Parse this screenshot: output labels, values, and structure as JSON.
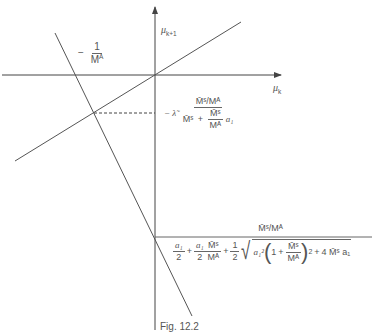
{
  "axes": {
    "x_label_symbol": "μ",
    "x_label_sub": "k",
    "y_label_symbol": "μ",
    "y_label_sub": "k+1"
  },
  "labels": {
    "slope_label": {
      "sign": "−",
      "numerator": "1",
      "denominator_base": "M",
      "denominator_sup": "A"
    },
    "intersection_label": {
      "prefix": "− λ̃",
      "numerator": "M̄ˢ/Mᴬ",
      "den_term1": "M̄ˢ",
      "plus": "+",
      "den_frac_num": "M̄ˢ",
      "den_frac_den": "Mᴬ",
      "den_tail": "a₁"
    },
    "intercept_label": {
      "numerator": "M̄ˢ/Mᴬ",
      "t1_num": "a₁",
      "t1_den": "2",
      "plus1": "+",
      "t2_num": "a₁",
      "t2_den": "2",
      "t2_frac_num": "M̄ˢ",
      "t2_frac_den": "Mᴬ",
      "plus2": "+",
      "t3_num": "1",
      "t3_den": "2",
      "root_a": "a₁²",
      "paren_open": "(",
      "paren_one": "1",
      "plus3": "+",
      "paren_frac_num": "M̄ˢ",
      "paren_frac_den": "Mᴬ",
      "paren_close": ")",
      "paren_sup": "2",
      "plus4": "+",
      "tail": "4 M̄ˢ a₁"
    }
  },
  "caption": "Fig. 12.2",
  "colors": {
    "line": "#555555",
    "text": "#555555"
  }
}
